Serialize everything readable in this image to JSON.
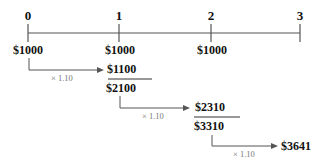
{
  "timeline": {
    "periods": [
      "0",
      "1",
      "2",
      "3"
    ],
    "deposits": [
      "$1000",
      "$1000",
      "$1000"
    ]
  },
  "steps": [
    {
      "multiplier": "× 1.10",
      "grown": "$1100",
      "sum": "$2100"
    },
    {
      "multiplier": "× 1.10",
      "grown": "$2310",
      "sum": "$3310"
    },
    {
      "multiplier": "× 1.10",
      "grown": "$3641"
    }
  ],
  "colors": {
    "line": "#555555",
    "text": "#111111",
    "multiplier": "#777777"
  }
}
